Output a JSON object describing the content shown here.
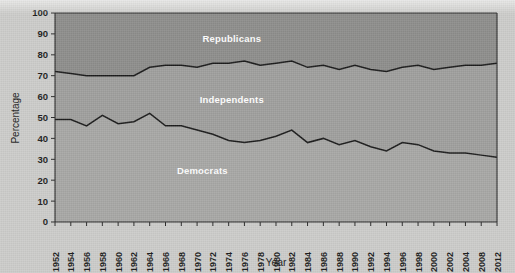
{
  "chart_data": {
    "type": "area",
    "title": "",
    "subtitle": "",
    "xlabel": "Year",
    "ylabel": "Percentage",
    "ylim": [
      0,
      100
    ],
    "xlim": [
      1952,
      2012
    ],
    "grid": false,
    "legend_position": "inline-band-labels",
    "stacked": true,
    "annotations": [
      {
        "text": "Republicans",
        "x": 1976,
        "y": 86
      },
      {
        "text": "Independents",
        "x": 1976,
        "y": 57
      },
      {
        "text": "Democrats",
        "x": 1972,
        "y": 23
      }
    ],
    "ytick_labels": [
      "0",
      "10",
      "20",
      "30",
      "40",
      "50",
      "60",
      "70",
      "80",
      "90",
      "100"
    ],
    "ytick_values": [
      0,
      10,
      20,
      30,
      40,
      50,
      60,
      70,
      80,
      90,
      100
    ],
    "xtick_labels": [
      "1952",
      "1954",
      "1956",
      "1958",
      "1960",
      "1962",
      "1964",
      "1966",
      "1968",
      "1970",
      "1972",
      "1974",
      "1976",
      "1978",
      "1980",
      "1982",
      "1984",
      "1986",
      "1988",
      "1990",
      "1992",
      "1994",
      "1996",
      "1998",
      "2000",
      "2002",
      "2004",
      "2008",
      "2012"
    ],
    "x": [
      1952,
      1954,
      1956,
      1958,
      1960,
      1962,
      1964,
      1966,
      1968,
      1970,
      1972,
      1974,
      1976,
      1978,
      1980,
      1982,
      1984,
      1986,
      1988,
      1990,
      1992,
      1994,
      1996,
      1998,
      2000,
      2002,
      2004,
      2008,
      2012
    ],
    "series": [
      {
        "name": "Democrats",
        "color": "#a8a8a6",
        "boundary_name": "democrat-upper-boundary",
        "values": [
          49,
          49,
          46,
          51,
          47,
          48,
          52,
          46,
          46,
          44,
          42,
          39,
          38,
          39,
          41,
          44,
          38,
          40,
          37,
          39,
          36,
          34,
          38,
          37,
          34,
          33,
          33,
          32,
          31
        ]
      },
      {
        "name": "Independents",
        "color": "#a0a09e",
        "boundary_name": "independent-upper-boundary",
        "cumulative_values": [
          72,
          71,
          70,
          70,
          70,
          70,
          74,
          75,
          75,
          74,
          76,
          76,
          77,
          75,
          76,
          77,
          74,
          75,
          73,
          75,
          73,
          72,
          74,
          75,
          73,
          74,
          75,
          75,
          76
        ]
      },
      {
        "name": "Republicans",
        "color": "#8e8e8c",
        "boundary_name": "chart-top",
        "cumulative_values": [
          100,
          100,
          100,
          100,
          100,
          100,
          100,
          100,
          100,
          100,
          100,
          100,
          100,
          100,
          100,
          100,
          100,
          100,
          100,
          100,
          100,
          100,
          100,
          100,
          100,
          100,
          100,
          100,
          100
        ]
      }
    ],
    "colors": {
      "background": "#cdcdcb",
      "republicans_band": "#8e8e8c",
      "independents_band": "#a0a09e",
      "democrats_band": "#a8a8a6",
      "line": "#1c1c1c",
      "axis": "#2b2b2b",
      "label_text": "#ffffff"
    }
  }
}
